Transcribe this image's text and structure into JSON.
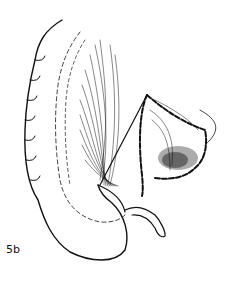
{
  "figure": {
    "label": "5b",
    "colors": {
      "ink": "#111111",
      "background": "#ffffff"
    }
  }
}
